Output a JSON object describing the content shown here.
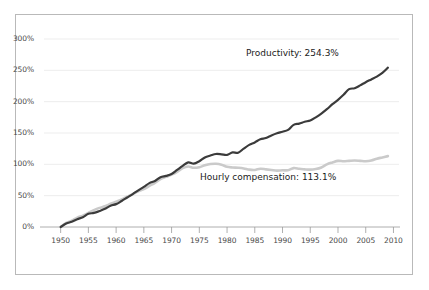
{
  "chart_data": {
    "type": "line",
    "title": "",
    "subtitle": "",
    "xlabel": "",
    "ylabel": "",
    "xlim": [
      1947,
      2011
    ],
    "ylim": [
      0,
      300
    ],
    "grid": true,
    "grid_axis": "y",
    "legend_position": "inline-annotation",
    "x_tick_labels": [
      "1950",
      "1955",
      "1960",
      "1965",
      "1970",
      "1975",
      "1980",
      "1985",
      "1990",
      "1995",
      "2000",
      "2005",
      "2010"
    ],
    "x_ticks": [
      1950,
      1955,
      1960,
      1965,
      1970,
      1975,
      1980,
      1985,
      1990,
      1995,
      2000,
      2005,
      2010
    ],
    "y_tick_labels": [
      "0%",
      "50%",
      "100%",
      "150%",
      "200%",
      "250%",
      "300%"
    ],
    "y_ticks": [
      0,
      50,
      100,
      150,
      200,
      250,
      300
    ],
    "annotations": [
      {
        "name": "productivity-label",
        "text": "Productivity: 254.3%",
        "x": 2000,
        "y": 272
      },
      {
        "name": "compensation-label",
        "text": "Hourly compensation: 113.1%",
        "x": 1988,
        "y": 64
      }
    ],
    "series": [
      {
        "name": "Productivity",
        "color": "#3b3b3b",
        "final_value": 254.3,
        "final_label": "Productivity: 254.3%",
        "x": [
          1950,
          1951,
          1952,
          1953,
          1954,
          1955,
          1956,
          1957,
          1958,
          1959,
          1960,
          1961,
          1962,
          1963,
          1964,
          1965,
          1966,
          1967,
          1968,
          1969,
          1970,
          1971,
          1972,
          1973,
          1974,
          1975,
          1976,
          1977,
          1978,
          1979,
          1980,
          1981,
          1982,
          1983,
          1984,
          1985,
          1986,
          1987,
          1988,
          1989,
          1990,
          1991,
          1992,
          1993,
          1994,
          1995,
          1996,
          1997,
          1998,
          1999,
          2000,
          2001,
          2002,
          2003,
          2004,
          2005,
          2006,
          2007,
          2008,
          2009
        ],
        "values": [
          0,
          5.5,
          8.5,
          12.5,
          15.5,
          21.0,
          22.5,
          25.5,
          29.0,
          34.0,
          36.5,
          41.5,
          47.0,
          52.5,
          58.5,
          64.0,
          70.0,
          73.5,
          79.5,
          81.5,
          84.5,
          91.0,
          97.5,
          103.0,
          101.0,
          105.0,
          111.0,
          114.0,
          116.5,
          116.0,
          115.0,
          119.0,
          118.5,
          125.0,
          131.0,
          135.0,
          140.0,
          142.0,
          146.0,
          149.5,
          152.0,
          155.0,
          163.0,
          165.0,
          168.0,
          170.0,
          175.0,
          181.0,
          188.0,
          196.0,
          203.0,
          211.0,
          220.0,
          221.5,
          226.0,
          231.0,
          235.5,
          240.0,
          246.0,
          254.3
        ]
      },
      {
        "name": "Hourly compensation",
        "color": "#cacaca",
        "final_value": 113.1,
        "final_label": "Hourly compensation: 113.1%",
        "x": [
          1950,
          1951,
          1952,
          1953,
          1954,
          1955,
          1956,
          1957,
          1958,
          1959,
          1960,
          1961,
          1962,
          1963,
          1964,
          1965,
          1966,
          1967,
          1968,
          1969,
          1970,
          1971,
          1972,
          1973,
          1974,
          1975,
          1976,
          1977,
          1978,
          1979,
          1980,
          1981,
          1982,
          1983,
          1984,
          1985,
          1986,
          1987,
          1988,
          1989,
          1990,
          1991,
          1992,
          1993,
          1994,
          1995,
          1996,
          1997,
          1998,
          1999,
          2000,
          2001,
          2002,
          2003,
          2004,
          2005,
          2006,
          2007,
          2008,
          2009
        ],
        "values": [
          0,
          6.5,
          10.0,
          15.0,
          18.0,
          22.5,
          27.0,
          30.5,
          33.0,
          37.0,
          40.5,
          44.0,
          48.5,
          52.5,
          57.0,
          60.5,
          65.5,
          70.5,
          76.5,
          80.0,
          83.5,
          88.0,
          94.0,
          96.5,
          94.5,
          95.5,
          98.5,
          100.5,
          101.0,
          99.5,
          96.0,
          95.0,
          94.5,
          93.5,
          91.5,
          91.0,
          93.0,
          92.0,
          91.0,
          90.0,
          90.5,
          90.5,
          94.0,
          93.0,
          92.0,
          91.5,
          92.5,
          95.0,
          100.0,
          103.0,
          105.5,
          105.0,
          105.5,
          106.0,
          105.5,
          105.0,
          106.0,
          109.0,
          111.0,
          113.1
        ]
      }
    ]
  },
  "colors": {
    "frame_border": "#b9b9b9",
    "axis_line": "#9a9a9a",
    "gridline": "#ededed",
    "tick_text": "#4a4a4a",
    "annotation_text": "#1b1b1b",
    "background": "#ffffff"
  }
}
